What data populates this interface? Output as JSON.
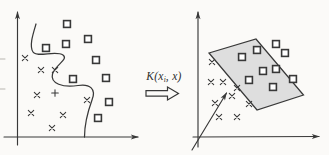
{
  "figure": {
    "background": "#fbfaf8",
    "ink": "#383838",
    "kernel_label": {
      "pre": "K(x",
      "sub": "i",
      "post": ", x)"
    },
    "kernel_arrow": {
      "icon": "hollow-right-arrow",
      "outline_points": "146,90.6 167.5,90.6 167.5,87 178.5,93.4 167.5,100 167.5,96.2 146,96.2",
      "fill": "#fbfaf8"
    },
    "input_space": {
      "v_axis": [
        17.5,
        145,
        17.5,
        12
      ],
      "h_axis": [
        4,
        137,
        138,
        137
      ],
      "boundary_curve": "M36,24 C33,34 29,46 33,52 C37,58 56,50 63,55 C69,59.5 55,65 52.5,74 C50,83.5 63,88 78,85.5 C90,83.5 96.5,89 92,100 C88,111 84.5,125 84.5,137",
      "squares": [
        [
          67,
          24
        ],
        [
          88,
          39
        ],
        [
          66,
          44
        ],
        [
          46,
          48
        ],
        [
          96,
          60
        ],
        [
          73,
          79
        ],
        [
          106,
          78
        ],
        [
          109,
          102
        ],
        [
          98,
          118
        ]
      ],
      "crosses": [
        [
          25,
          58
        ],
        [
          41,
          70
        ],
        [
          55,
          70
        ],
        [
          37,
          95
        ],
        [
          31,
          113
        ],
        [
          63,
          115
        ],
        [
          52,
          128
        ],
        [
          87,
          100
        ]
      ],
      "plusses": [
        [
          55,
          93
        ]
      ],
      "edge_marks": [
        [
          0,
          59,
          5,
          59
        ],
        [
          0,
          89,
          5,
          89
        ]
      ]
    },
    "feature_space": {
      "v_axis": [
        198,
        147,
        198,
        12
      ],
      "h_axis": [
        193,
        137,
        319,
        136.5
      ],
      "vector": [
        192,
        150,
        226.5,
        93
      ],
      "parallelogram": {
        "points": "209,53 256,39 303.5,95 257,110",
        "fill": "#dedede"
      },
      "squares": [
        [
          242,
          57
        ],
        [
          257,
          50
        ],
        [
          276,
          44
        ],
        [
          285,
          53
        ],
        [
          263,
          71
        ],
        [
          276,
          69
        ],
        [
          249,
          80
        ],
        [
          273,
          87
        ],
        [
          293,
          79
        ]
      ],
      "crosses": [
        [
          212,
          62
        ],
        [
          211,
          82
        ],
        [
          223,
          82
        ],
        [
          237,
          88
        ],
        [
          232,
          96
        ],
        [
          215,
          103
        ],
        [
          249,
          104
        ],
        [
          219,
          117
        ],
        [
          237,
          117
        ]
      ]
    }
  }
}
